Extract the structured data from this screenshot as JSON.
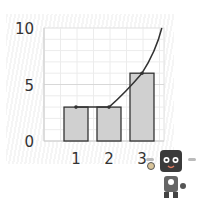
{
  "chart_data": {
    "type": "bar",
    "title": "",
    "xlabel": "",
    "ylabel": "",
    "categories": [
      "1",
      "2",
      "3"
    ],
    "values": [
      3,
      3,
      6
    ],
    "ylim": [
      0,
      10
    ],
    "yticks": [
      "0",
      "5",
      "10"
    ],
    "grid": true,
    "overlay_line": {
      "description": "curve through bar tops rising steeply",
      "points": [
        [
          1,
          3
        ],
        [
          2,
          3
        ],
        [
          3,
          6
        ],
        [
          3.6,
          10
        ]
      ]
    },
    "colors": {
      "bar": "#d0d0d0",
      "bar_edge": "#333333",
      "line": "#333333",
      "grid": "#e6e6e6"
    }
  },
  "mascot": {
    "icon": "robot-icon"
  }
}
